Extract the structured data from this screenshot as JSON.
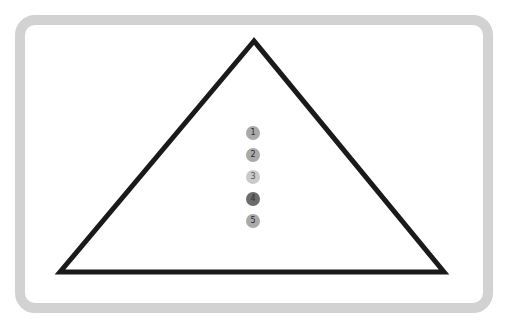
{
  "diagram": {
    "type": "pyramid",
    "frame": {
      "border_color": "#d2d2d2"
    },
    "triangle": {
      "stroke_color": "#1a1a1a",
      "apex": [
        254,
        41
      ],
      "bottom_left": [
        60,
        272
      ],
      "bottom_right": [
        444,
        272
      ]
    },
    "steps": [
      {
        "label": "1",
        "color": "#a9a9a9",
        "text_color": "#2a2a2a"
      },
      {
        "label": "2",
        "color": "#a9a9a9",
        "text_color": "#2a2a2a"
      },
      {
        "label": "3",
        "color": "#cacaca",
        "text_color": "#555555"
      },
      {
        "label": "4",
        "color": "#6c6c6c",
        "text_color": "#333333"
      },
      {
        "label": "5",
        "color": "#a9a9a9",
        "text_color": "#2a2a2a"
      }
    ]
  }
}
